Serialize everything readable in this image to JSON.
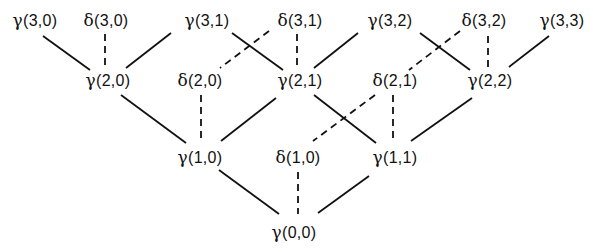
{
  "diagram": {
    "type": "lattice",
    "nodes": [
      {
        "id": "g30",
        "symbol": "γ",
        "args": "(3,0)",
        "x": 35,
        "y": 20
      },
      {
        "id": "d30",
        "symbol": "δ",
        "args": "(3,0)",
        "x": 106,
        "y": 20
      },
      {
        "id": "g31",
        "symbol": "γ",
        "args": "(3,1)",
        "x": 207,
        "y": 20
      },
      {
        "id": "d31",
        "symbol": "δ",
        "args": "(3,1)",
        "x": 300,
        "y": 20
      },
      {
        "id": "g32",
        "symbol": "γ",
        "args": "(3,2)",
        "x": 390,
        "y": 20
      },
      {
        "id": "d32",
        "symbol": "δ",
        "args": "(3,2)",
        "x": 484,
        "y": 20
      },
      {
        "id": "g33",
        "symbol": "γ",
        "args": "(3,3)",
        "x": 562,
        "y": 20
      },
      {
        "id": "g20",
        "symbol": "γ",
        "args": "(2,0)",
        "x": 108,
        "y": 80
      },
      {
        "id": "d20",
        "symbol": "δ",
        "args": "(2,0)",
        "x": 200,
        "y": 80
      },
      {
        "id": "g21",
        "symbol": "γ",
        "args": "(2,1)",
        "x": 300,
        "y": 80
      },
      {
        "id": "d21",
        "symbol": "δ",
        "args": "(2,1)",
        "x": 395,
        "y": 80
      },
      {
        "id": "g22",
        "symbol": "γ",
        "args": "(2,2)",
        "x": 490,
        "y": 80
      },
      {
        "id": "g10",
        "symbol": "γ",
        "args": "(1,0)",
        "x": 200,
        "y": 157
      },
      {
        "id": "d10",
        "symbol": "δ",
        "args": "(1,0)",
        "x": 298,
        "y": 157
      },
      {
        "id": "g11",
        "symbol": "γ",
        "args": "(1,1)",
        "x": 395,
        "y": 157
      },
      {
        "id": "g00",
        "symbol": "γ",
        "args": "(0,0)",
        "x": 294,
        "y": 232
      }
    ],
    "edges": [
      {
        "from": "g30",
        "to": "g20",
        "style": "solid",
        "x1": 43,
        "y1": 36,
        "x2": 90,
        "y2": 70
      },
      {
        "from": "d30",
        "to": "g20",
        "style": "dashed",
        "x1": 105,
        "y1": 34,
        "x2": 105,
        "y2": 68
      },
      {
        "from": "g31",
        "to": "g20",
        "style": "solid",
        "x1": 171,
        "y1": 33,
        "x2": 126,
        "y2": 68
      },
      {
        "from": "g31",
        "to": "g21",
        "style": "solid",
        "x1": 232,
        "y1": 33,
        "x2": 283,
        "y2": 70
      },
      {
        "from": "d31",
        "to": "d20",
        "style": "dashed",
        "x1": 269,
        "y1": 31,
        "x2": 220,
        "y2": 68
      },
      {
        "from": "d31",
        "to": "g21",
        "style": "dashed",
        "x1": 297,
        "y1": 34,
        "x2": 297,
        "y2": 68
      },
      {
        "from": "g32",
        "to": "g21",
        "style": "solid",
        "x1": 358,
        "y1": 33,
        "x2": 314,
        "y2": 68
      },
      {
        "from": "g32",
        "to": "g22",
        "style": "solid",
        "x1": 420,
        "y1": 33,
        "x2": 470,
        "y2": 70
      },
      {
        "from": "d32",
        "to": "d21",
        "style": "dashed",
        "x1": 460,
        "y1": 31,
        "x2": 409,
        "y2": 70
      },
      {
        "from": "d32",
        "to": "g22",
        "style": "dashed",
        "x1": 488,
        "y1": 36,
        "x2": 488,
        "y2": 68
      },
      {
        "from": "g33",
        "to": "g22",
        "style": "solid",
        "x1": 549,
        "y1": 36,
        "x2": 509,
        "y2": 67
      },
      {
        "from": "g20",
        "to": "g10",
        "style": "solid",
        "x1": 121,
        "y1": 95,
        "x2": 186,
        "y2": 143
      },
      {
        "from": "d20",
        "to": "g10",
        "style": "dashed",
        "x1": 201,
        "y1": 95,
        "x2": 201,
        "y2": 143
      },
      {
        "from": "g21",
        "to": "g10",
        "style": "solid",
        "x1": 276,
        "y1": 98,
        "x2": 221,
        "y2": 141
      },
      {
        "from": "g21",
        "to": "g11",
        "style": "solid",
        "x1": 314,
        "y1": 95,
        "x2": 376,
        "y2": 143
      },
      {
        "from": "d21",
        "to": "d10",
        "style": "dashed",
        "x1": 375,
        "y1": 95,
        "x2": 313,
        "y2": 141
      },
      {
        "from": "d21",
        "to": "g11",
        "style": "dashed",
        "x1": 393,
        "y1": 95,
        "x2": 393,
        "y2": 141
      },
      {
        "from": "g22",
        "to": "g11",
        "style": "solid",
        "x1": 472,
        "y1": 98,
        "x2": 411,
        "y2": 141
      },
      {
        "from": "g10",
        "to": "g00",
        "style": "solid",
        "x1": 219,
        "y1": 170,
        "x2": 279,
        "y2": 214
      },
      {
        "from": "d10",
        "to": "g00",
        "style": "dashed",
        "x1": 298,
        "y1": 172,
        "x2": 298,
        "y2": 214
      },
      {
        "from": "g11",
        "to": "g00",
        "style": "solid",
        "x1": 369,
        "y1": 176,
        "x2": 318,
        "y2": 213
      }
    ]
  }
}
